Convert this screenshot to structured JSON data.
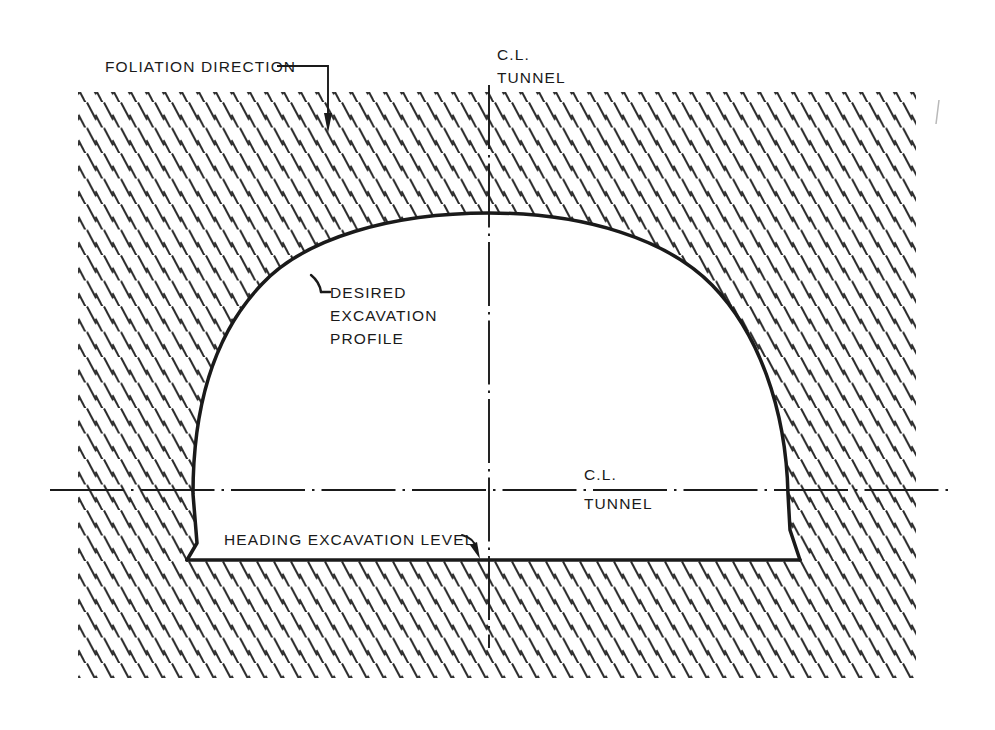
{
  "figure": {
    "type": "engineering-section-diagram",
    "background_color": "#ffffff",
    "line_color": "#1a1a1a"
  },
  "labels": {
    "foliation_direction": "FOLIATION DIRECTION",
    "centerline_top": {
      "line1": "C.L.",
      "line2": "TUNNEL"
    },
    "desired_excavation_profile": {
      "line1": "DESIRED",
      "line2": "EXCAVATION",
      "line3": "PROFILE"
    },
    "centerline_mid": {
      "line1": "C.L.",
      "line2": "TUNNEL"
    },
    "heading_excavation_level": "HEADING EXCAVATION LEVEL"
  },
  "geometry": {
    "tunnel_center_x": 489,
    "crown_y": 213,
    "springline_y": 490,
    "floor_y": 560,
    "left_wall_x": 187,
    "right_wall_x": 790,
    "hatch_angle_deg": 62,
    "hatch_dash_length": 19,
    "hatch_spacing_x": 17,
    "hatch_spacing_y": 25
  },
  "colors": {
    "ink": "#1a1a1a",
    "hatch": "#2b2b2b",
    "paper": "#ffffff"
  }
}
